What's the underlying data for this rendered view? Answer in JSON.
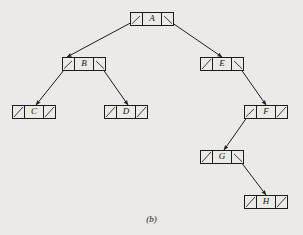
{
  "figure": {
    "caption": "(b)",
    "caption_x": 0,
    "caption_y": 214,
    "background_color": "#ebeae7",
    "ink_color": "#1c1c1c"
  },
  "nodes": [
    {
      "id": "A",
      "label": "A",
      "x": 130,
      "y": 12,
      "w": 44,
      "h": 14,
      "left_cell": "pointer",
      "right_cell": "pointer"
    },
    {
      "id": "B",
      "label": "B",
      "x": 62,
      "y": 57,
      "w": 44,
      "h": 14,
      "left_cell": "pointer",
      "right_cell": "pointer"
    },
    {
      "id": "C",
      "label": "C",
      "x": 12,
      "y": 105,
      "w": 44,
      "h": 14,
      "left_cell": "null",
      "right_cell": "null"
    },
    {
      "id": "D",
      "label": "D",
      "x": 104,
      "y": 105,
      "w": 44,
      "h": 14,
      "left_cell": "null",
      "right_cell": "null"
    },
    {
      "id": "E",
      "label": "E",
      "x": 200,
      "y": 57,
      "w": 44,
      "h": 14,
      "left_cell": "null",
      "right_cell": "pointer"
    },
    {
      "id": "F",
      "label": "F",
      "x": 244,
      "y": 105,
      "w": 44,
      "h": 14,
      "left_cell": "pointer",
      "right_cell": "null"
    },
    {
      "id": "G",
      "label": "G",
      "x": 200,
      "y": 150,
      "w": 44,
      "h": 14,
      "left_cell": "null",
      "right_cell": "pointer"
    },
    {
      "id": "H",
      "label": "H",
      "x": 244,
      "y": 195,
      "w": 44,
      "h": 14,
      "left_cell": "null",
      "right_cell": "null"
    }
  ],
  "edges": [
    {
      "id": "A-B",
      "from": "A",
      "to": "B",
      "side": "left",
      "x1": 136,
      "y1": 20,
      "x2": 67,
      "y2": 57
    },
    {
      "id": "A-E",
      "from": "A",
      "to": "E",
      "side": "right",
      "x1": 168,
      "y1": 20,
      "x2": 222,
      "y2": 57
    },
    {
      "id": "B-C",
      "from": "B",
      "to": "C",
      "side": "left",
      "x1": 68,
      "y1": 65,
      "x2": 36,
      "y2": 105
    },
    {
      "id": "B-D",
      "from": "B",
      "to": "D",
      "side": "right",
      "x1": 100,
      "y1": 65,
      "x2": 128,
      "y2": 105
    },
    {
      "id": "E-F",
      "from": "E",
      "to": "F",
      "side": "right",
      "x1": 238,
      "y1": 65,
      "x2": 266,
      "y2": 105
    },
    {
      "id": "F-G",
      "from": "F",
      "to": "G",
      "side": "left",
      "x1": 250,
      "y1": 113,
      "x2": 224,
      "y2": 150
    },
    {
      "id": "G-H",
      "from": "G",
      "to": "H",
      "side": "right",
      "x1": 238,
      "y1": 158,
      "x2": 266,
      "y2": 195
    }
  ]
}
